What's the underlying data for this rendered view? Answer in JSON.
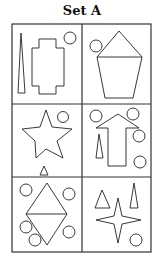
{
  "title": "Set A",
  "grid": {
    "rows": 3,
    "cols": 2,
    "left": 12,
    "top": 24,
    "right": 151,
    "bottom": 252,
    "mid_x": 82,
    "row_lines": [
      104,
      177
    ]
  },
  "colors": {
    "stroke": "#222222",
    "grid": "#333333",
    "background": "#ffffff"
  },
  "cells": [
    {
      "id": 1,
      "shapes": [
        "thin-triangle",
        "cross-polygon"
      ],
      "circles": [
        [
          70,
          38,
          6
        ]
      ],
      "circle_count": 1
    },
    {
      "id": 2,
      "shapes": [
        "house-pentagon"
      ],
      "circles": [
        [
          96,
          46,
          6
        ]
      ],
      "circle_count": 1
    },
    {
      "id": 3,
      "shapes": [
        "five-point-star",
        "small-triangle"
      ],
      "circles": [
        [
          63,
          117,
          5.5
        ]
      ],
      "circle_count": 1
    },
    {
      "id": 4,
      "shapes": [
        "up-arrow",
        "thin-triangle"
      ],
      "circles": [
        [
          96,
          116,
          6
        ],
        [
          133,
          114,
          6
        ],
        [
          139,
          136,
          6
        ],
        [
          140,
          162,
          6
        ]
      ],
      "circle_count": 4
    },
    {
      "id": 5,
      "shapes": [
        "diamond-split"
      ],
      "circles": [
        [
          26,
          190,
          6
        ],
        [
          69,
          194,
          6
        ],
        [
          26,
          227,
          6
        ],
        [
          35,
          240,
          6
        ],
        [
          69,
          232,
          6
        ]
      ],
      "circle_count": 5
    },
    {
      "id": 6,
      "shapes": [
        "triangle",
        "thin-triangle",
        "four-point-star"
      ],
      "circles": [
        [
          136,
          240,
          6
        ]
      ],
      "circle_count": 1
    }
  ]
}
